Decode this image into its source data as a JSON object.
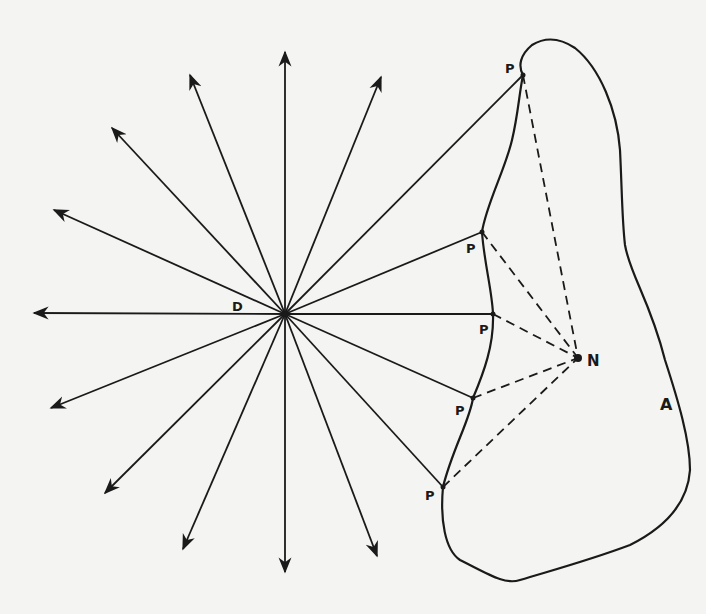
{
  "diagram": {
    "colors": {
      "background": "#f4f4f2",
      "ink": "#1a1a1a"
    },
    "center": {
      "label": "D",
      "x": 285,
      "y": 314
    },
    "target": {
      "label": "N",
      "x": 578,
      "y": 358
    },
    "region_label": {
      "text": "A",
      "x": 660,
      "y": 410
    },
    "rays": [
      {
        "x": 285,
        "y": 52
      },
      {
        "x": 381,
        "y": 77
      },
      {
        "x": 190,
        "y": 75
      },
      {
        "x": 112,
        "y": 128
      },
      {
        "x": 54,
        "y": 210
      },
      {
        "x": 34,
        "y": 313
      },
      {
        "x": 51,
        "y": 408
      },
      {
        "x": 105,
        "y": 493
      },
      {
        "x": 183,
        "y": 549
      },
      {
        "x": 285,
        "y": 572
      },
      {
        "x": 377,
        "y": 556
      }
    ],
    "boundary_points": [
      {
        "label": "P",
        "x": 523,
        "y": 75,
        "label_x": 505,
        "label_y": 73
      },
      {
        "label": "P",
        "x": 482,
        "y": 232,
        "label_x": 466,
        "label_y": 253
      },
      {
        "label": "P",
        "x": 493,
        "y": 314,
        "label_x": 479,
        "label_y": 334
      },
      {
        "label": "P",
        "x": 473,
        "y": 398,
        "label_x": 455,
        "label_y": 415
      },
      {
        "label": "P",
        "x": 443,
        "y": 487,
        "label_x": 425,
        "label_y": 500
      }
    ],
    "labels": [
      "D",
      "P",
      "P",
      "P",
      "P",
      "P",
      "N",
      "A"
    ]
  }
}
